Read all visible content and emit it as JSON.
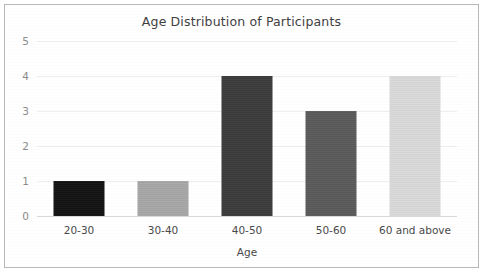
{
  "chart_data": {
    "type": "bar",
    "title": "Age Distribution of Participants",
    "xlabel": "Age",
    "ylabel": "",
    "categories": [
      "20-30",
      "30-40",
      "40-50",
      "50-60",
      "60 and above"
    ],
    "values": [
      1,
      1,
      4,
      3,
      4
    ],
    "series": [
      {
        "name": "Count",
        "values": [
          1,
          1,
          4,
          3,
          4
        ]
      }
    ],
    "bar_colors": [
      "#111111",
      "#a6a6a6",
      "#3a3a3a",
      "#595959",
      "#d9d9d9"
    ],
    "ylim": [
      0,
      5
    ],
    "ytick_labels": [
      "0",
      "1",
      "2",
      "3",
      "4",
      "5"
    ],
    "ytick_values": [
      0,
      1,
      2,
      3,
      4,
      5
    ],
    "grid": true,
    "legend": false,
    "legend_position": "none"
  },
  "style": {
    "background_color": "#ffffff",
    "border_color": "#b9b9b9",
    "gridline_color": "#efefef",
    "baseline_color": "#d8d8d8",
    "title_color": "#3f3f3f",
    "ytick_color": "#8c8c8c",
    "xtick_color": "#4a4a4a"
  }
}
